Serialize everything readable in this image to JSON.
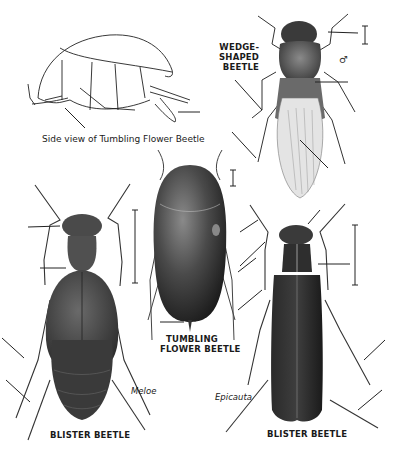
{
  "plate": {
    "background": "#ffffff",
    "ink": "#1a1a1a",
    "beetle_dark": "#2a2a2a",
    "beetle_mid": "#555555",
    "beetle_light": "#9a9a9a"
  },
  "figures": {
    "side_view": {
      "caption": "Side view of Tumbling Flower Beetle"
    },
    "wedge_shaped": {
      "label_line1": "WEDGE-",
      "label_line2": "SHAPED",
      "label_line3": "BEETLE",
      "sex_symbol": "♂"
    },
    "tumbling_flower": {
      "label_line1": "TUMBLING",
      "label_line2": "FLOWER BEETLE"
    },
    "blister_meloe": {
      "genus": "Meloe",
      "label": "BLISTER BEETLE"
    },
    "blister_epicauta": {
      "genus": "Epicauta",
      "label": "BLISTER BEETLE"
    }
  }
}
